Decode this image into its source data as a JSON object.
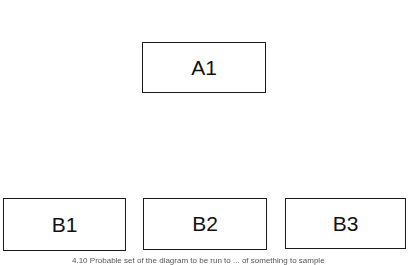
{
  "diagram": {
    "nodes": [
      {
        "id": "A1",
        "label": "A1",
        "level": 1
      },
      {
        "id": "B1",
        "label": "B1",
        "level": 2
      },
      {
        "id": "B2",
        "label": "B2",
        "level": 2
      },
      {
        "id": "B3",
        "label": "B3",
        "level": 2
      }
    ],
    "caption": "4.10 Probable set of the diagram to be run to ... of something to sample"
  }
}
